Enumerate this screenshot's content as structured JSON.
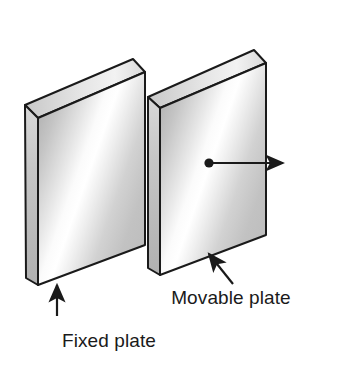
{
  "figure": {
    "background_color": "#ffffff",
    "width": 361,
    "height": 365
  },
  "labels": {
    "fixed_plate": "Fixed plate",
    "movable_plate": "Movable plate"
  },
  "objects": {
    "fixed_plate": {
      "name": "Fixed plate",
      "role": "stationary-plate",
      "outline_color": "#1a1a1a",
      "face_light": "#fdfdfd",
      "face_mid": "#c9c9c9",
      "face_dark": "#9a9a9a",
      "edge_color": "#b4b4b4",
      "top_color": "#e2e2e2"
    },
    "movable_plate": {
      "name": "Movable plate",
      "role": "translating-plate",
      "outline_color": "#1a1a1a",
      "face_light": "#fdfdfd",
      "face_mid": "#c9c9c9",
      "face_dark": "#9a9a9a",
      "edge_color": "#b4b4b4",
      "top_color": "#e2e2e2"
    }
  },
  "annotations": {
    "motion_arrow": {
      "name": "motion-direction-arrow",
      "description": "Horizontal arrow from a point on the movable plate pointing right",
      "color": "#1a1a1a",
      "direction": "right"
    },
    "motion_point": {
      "name": "motion-origin-dot",
      "description": "Filled dot marking the point of applied displacement",
      "color": "#1a1a1a"
    },
    "fixed_leader": {
      "name": "fixed-plate-leader-arrow",
      "description": "Vertical arrow pointing up to the fixed plate",
      "color": "#1a1a1a",
      "direction": "up"
    },
    "movable_leader": {
      "name": "movable-plate-leader-arrow",
      "description": "Diagonal arrow pointing up-left to the movable plate",
      "color": "#1a1a1a",
      "direction": "up-left"
    }
  }
}
